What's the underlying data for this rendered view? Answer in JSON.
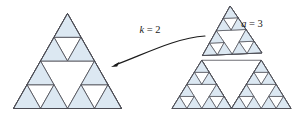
{
  "figure": {
    "background": "#ffffff",
    "fill_color": "#dce8f2",
    "stroke_color": "#4a4a52",
    "arrow_color": "#1a1a1a"
  },
  "labels": {
    "k": {
      "text": "k = 2",
      "var": "k",
      "value": "2",
      "x": 150,
      "y": 33
    },
    "a": {
      "text": "a = 3",
      "var": "a",
      "value": "3",
      "x": 252,
      "y": 27
    }
  },
  "arrow": {
    "name": "curved-arrow",
    "from_x": 205,
    "from_y": 36,
    "to_x": 111,
    "to_y": 67,
    "direction": "right-to-left"
  },
  "left_figure": {
    "name": "sierpinski-depth-2",
    "depth": 2,
    "apex_x": 67.5,
    "apex_y": 13.5,
    "left_x": 13.5,
    "right_x": 121.5,
    "base_y": 108.5
  },
  "right_figure": {
    "name": "sierpinski-depth-3-split",
    "depth": 3,
    "apex_x": 231.5,
    "apex_y": 12.0,
    "left_x": 172.0,
    "right_x": 291.0,
    "base_y": 108.5,
    "top_piece_detached": true,
    "top_piece_offset_y": -6,
    "top_piece_rotation_deg": -2.5
  }
}
